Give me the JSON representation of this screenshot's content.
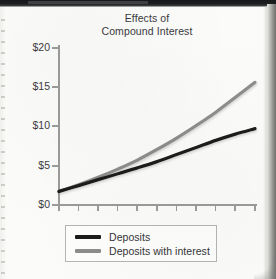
{
  "chart_data": {
    "type": "line",
    "title": "Effects of Compound Interest",
    "title_lines": [
      "Effects of",
      "Compound Interest"
    ],
    "xlabel": "",
    "ylabel": "",
    "ylim": [
      0,
      20
    ],
    "xlim": [
      0,
      10
    ],
    "grid": false,
    "legend_position": "below-plot",
    "y_ticks": [
      0,
      5,
      10,
      15,
      20
    ],
    "y_tick_labels": [
      "$0",
      "$5",
      "$10",
      "$15",
      "$20"
    ],
    "x_tick_count": 11,
    "x_tick_labels": [],
    "x": [
      0,
      1,
      2,
      3,
      4,
      5,
      6,
      7,
      8,
      9,
      10
    ],
    "series": [
      {
        "name": "Deposits",
        "color": "#1b1b1b",
        "values": [
          1.6,
          2.35,
          3.1,
          3.85,
          4.6,
          5.4,
          6.3,
          7.2,
          8.1,
          8.9,
          9.6
        ]
      },
      {
        "name": "Deposits with interest",
        "color": "#8d8d8b",
        "values": [
          1.6,
          2.45,
          3.4,
          4.45,
          5.6,
          6.95,
          8.4,
          10.0,
          11.7,
          13.6,
          15.5
        ]
      }
    ]
  },
  "chart": {
    "title_line_1": "Effects of",
    "title_line_2": "Compound Interest"
  },
  "y_axis": {
    "labels": [
      "$20",
      "$15",
      "$10",
      "$5",
      "$0"
    ]
  },
  "legend": {
    "items": [
      {
        "label": "Deposits",
        "color": "#1b1b1b"
      },
      {
        "label": "Deposits with interest",
        "color": "#8d8d8b"
      }
    ]
  },
  "colors": {
    "deposits": "#1b1b1b",
    "deposits_with_interest": "#8d8d8b",
    "axis": "#9b9b99",
    "text": "#3a3a3c",
    "page": "#fbfbfa"
  }
}
